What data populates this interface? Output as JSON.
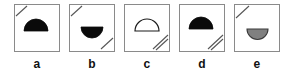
{
  "figure": {
    "type": "multiple-choice-shape-panels",
    "panel_count": 5,
    "background_color": "#ffffff",
    "border_color": "#8a8a8a",
    "colors": {
      "black_fill": "#0a0a0a",
      "gray_fill": "#808080",
      "white_fill": "#ffffff",
      "outline": "#1a1a1a",
      "slash_line": "#555555",
      "label_color": "#111111"
    },
    "panels": [
      {
        "label": "a",
        "shape": "semicircle",
        "orientation": "dome-up",
        "fill": "black",
        "fill_color": "#0a0a0a",
        "corner_marks": {
          "top_left": {
            "present": true,
            "lines": 1
          },
          "bottom_right": {
            "present": false,
            "lines": 0
          }
        }
      },
      {
        "label": "b",
        "shape": "semicircle",
        "orientation": "bowl-down",
        "fill": "black",
        "fill_color": "#0a0a0a",
        "corner_marks": {
          "top_left": {
            "present": true,
            "lines": 1
          },
          "bottom_right": {
            "present": true,
            "lines": 1
          }
        }
      },
      {
        "label": "c",
        "shape": "semicircle",
        "orientation": "dome-up",
        "fill": "white",
        "fill_color": "#ffffff",
        "corner_marks": {
          "top_left": {
            "present": false,
            "lines": 0
          },
          "bottom_right": {
            "present": true,
            "lines": 2
          }
        }
      },
      {
        "label": "d",
        "shape": "semicircle",
        "orientation": "dome-up",
        "fill": "black",
        "fill_color": "#0a0a0a",
        "corner_marks": {
          "top_left": {
            "present": false,
            "lines": 0
          },
          "bottom_right": {
            "present": true,
            "lines": 2
          }
        }
      },
      {
        "label": "e",
        "shape": "semicircle",
        "orientation": "bowl-down",
        "fill": "gray",
        "fill_color": "#808080",
        "corner_marks": {
          "top_left": {
            "present": true,
            "lines": 1
          },
          "bottom_right": {
            "present": false,
            "lines": 0
          }
        }
      }
    ]
  }
}
